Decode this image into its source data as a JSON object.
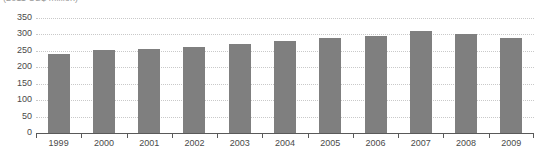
{
  "chart_data": {
    "type": "bar",
    "title": "",
    "subtitle": "(2011 US$ million)",
    "xlabel": "",
    "ylabel": "",
    "categories": [
      "1999",
      "2000",
      "2001",
      "2002",
      "2003",
      "2004",
      "2005",
      "2006",
      "2007",
      "2008",
      "2009"
    ],
    "values": [
      240,
      252,
      255,
      263,
      270,
      281,
      289,
      295,
      310,
      300,
      290
    ],
    "series": [
      {
        "name": "",
        "values": [
          240,
          252,
          255,
          263,
          270,
          281,
          289,
          295,
          310,
          300,
          290
        ]
      }
    ],
    "ylim": [
      0,
      350
    ],
    "ytick_step": 50,
    "yticks": [
      0,
      50,
      100,
      150,
      200,
      250,
      300,
      350
    ],
    "ytick_labels": [
      "0",
      "50",
      "100",
      "150",
      "200",
      "250",
      "300",
      "350"
    ],
    "grid": true,
    "grid_style": "dotted",
    "legend": false,
    "legend_position": "none",
    "bar_color": "#7f7f7f",
    "grid_color": "#c9c9c9",
    "axis_color": "#595959",
    "text_color": "#4a4a4a",
    "background": "#ffffff"
  }
}
